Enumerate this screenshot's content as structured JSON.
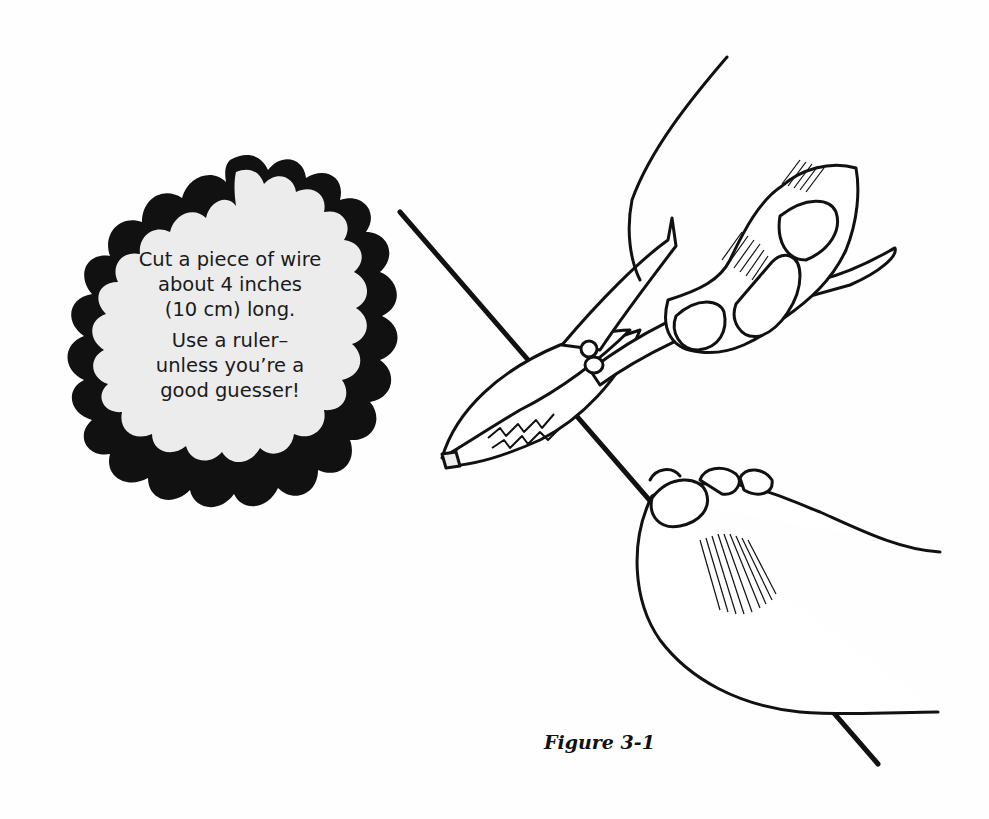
{
  "callout": {
    "shape": "scalloped-cloud-bubble",
    "fill_color": "#ececec",
    "outline_color": "#111111",
    "paragraphs": [
      {
        "lines": [
          "Cut a piece of wire",
          "about 4 inches",
          "(10 cm) long."
        ]
      },
      {
        "lines": [
          "Use a ruler–",
          "unless you’re a",
          "good guesser!"
        ]
      }
    ]
  },
  "illustration": {
    "subject": "hands-cutting-wire-with-pliers",
    "elements": [
      "wire",
      "pliers",
      "right-hand-holding-pliers",
      "left-hand-holding-wire"
    ]
  },
  "caption": "Figure 3-1"
}
